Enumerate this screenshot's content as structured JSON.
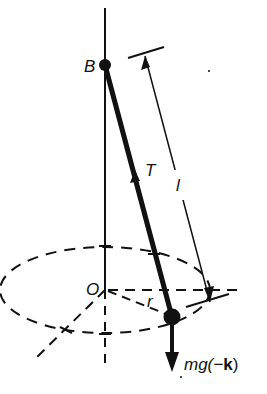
{
  "diagram": {
    "type": "conical-pendulum",
    "labels": {
      "pivot": "B",
      "origin": "O",
      "tension": "T",
      "length": "l",
      "radius": "r",
      "weight_prefix": "mg(−",
      "weight_vector": "k",
      "weight_suffix": ")"
    },
    "colors": {
      "ink": "#111111",
      "background": "#ffffff"
    }
  }
}
